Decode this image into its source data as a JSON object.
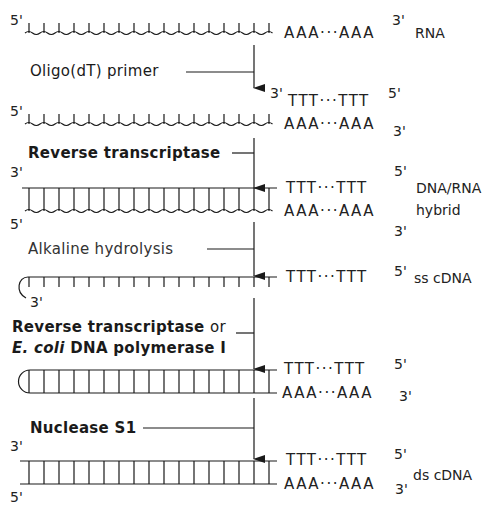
{
  "diagram": {
    "stages": [
      {
        "id": "rna",
        "strand_top": {
          "five_prime": "5'",
          "three_prime": "3'",
          "tail": "AAA···AAA"
        },
        "name": "RNA"
      },
      {
        "id": "primer",
        "step_label": "Oligo(dT) primer",
        "primer": {
          "three_prime": "3'",
          "seq": "TTT···TTT",
          "five_prime": "5'"
        },
        "rna": {
          "five_prime": "5'",
          "tail": "AAA···AAA",
          "three_prime": "3'"
        }
      },
      {
        "id": "hybrid",
        "step_label": "Reverse transcriptase",
        "top": {
          "three_prime": "3'",
          "seq": "TTT···TTT",
          "five_prime": "5'"
        },
        "bottom": {
          "five_prime": "5'",
          "seq": "AAA···AAA",
          "three_prime": "3'"
        },
        "name_line1": "DNA/RNA",
        "name_line2": "hybrid"
      },
      {
        "id": "sscdna",
        "step_label": "Alkaline hydrolysis",
        "strand": {
          "seq": "TTT···TTT",
          "five_prime": "5'",
          "three_prime": "3'"
        },
        "name": "ss cDNA"
      },
      {
        "id": "second_strand",
        "step_label_line1": "Reverse transcriptase",
        "step_label_or": "or",
        "step_label_line2_italic": "E. coli",
        "step_label_line2_rest": "DNA polymerase I",
        "top": {
          "seq": "TTT···TTT",
          "five_prime": "5'"
        },
        "bottom": {
          "seq": "AAA···AAA",
          "three_prime": "3'"
        }
      },
      {
        "id": "dscdna",
        "step_label": "Nuclease S1",
        "top": {
          "three_prime": "3'",
          "seq": "TTT···TTT",
          "five_prime": "5'"
        },
        "bottom": {
          "five_prime": "5'",
          "seq": "AAA···AAA",
          "three_prime": "3'"
        },
        "name": "ds cDNA"
      }
    ]
  }
}
